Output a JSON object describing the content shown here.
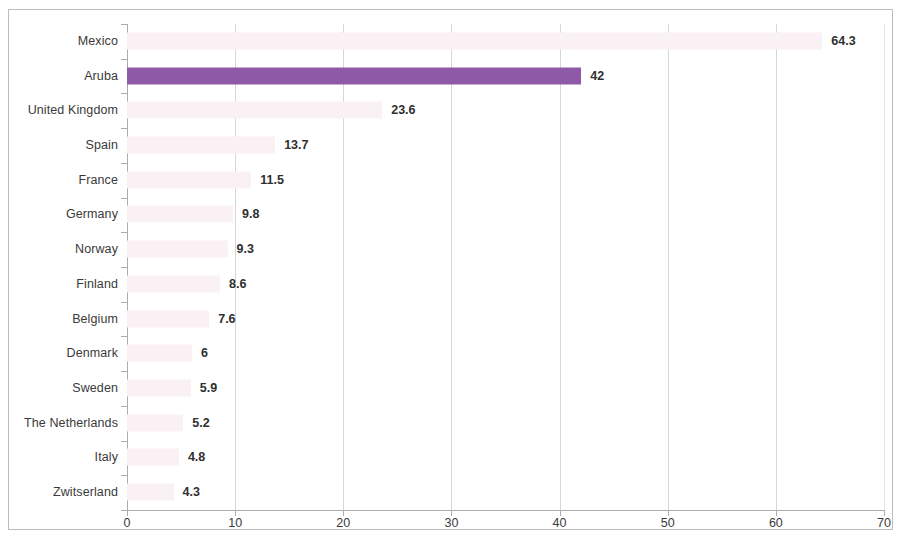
{
  "chart_data": {
    "type": "bar",
    "orientation": "horizontal",
    "title": "",
    "subtitle": "",
    "xlabel": "",
    "ylabel": "",
    "xlim": [
      0,
      70
    ],
    "xticks": [
      0,
      10,
      20,
      30,
      40,
      50,
      60,
      70
    ],
    "xticklabels": [
      "0",
      "10",
      "20",
      "30",
      "40",
      "50",
      "60",
      "70"
    ],
    "grid": true,
    "grid_axis": "x",
    "legend": false,
    "categories": [
      "Mexico",
      "Aruba",
      "United Kingdom",
      "Spain",
      "France",
      "Germany",
      "Norway",
      "Finland",
      "Belgium",
      "Denmark",
      "Sweden",
      "The Netherlands",
      "Italy",
      "Zwitserland"
    ],
    "values": [
      64.3,
      42,
      23.6,
      13.7,
      11.5,
      9.8,
      9.3,
      8.6,
      7.6,
      6,
      5.9,
      5.2,
      4.8,
      4.3
    ],
    "value_labels": [
      "64.3",
      "42",
      "23.6",
      "13.7",
      "11.5",
      "9.8",
      "9.3",
      "8.6",
      "7.6",
      "6",
      "5.9",
      "5.2",
      "4.8",
      "4.3"
    ],
    "highlighted_category": "Aruba",
    "bar_colors": {
      "highlight": "#8e5aa8",
      "default": "#faf1f5"
    }
  },
  "colors": {
    "frame_border": "#b9bcc0",
    "gridline": "#d4d6d9",
    "axis_line": "#a9acb0",
    "text": "#3a3a3a",
    "value_text": "#2f2f2f",
    "background": "#ffffff"
  }
}
